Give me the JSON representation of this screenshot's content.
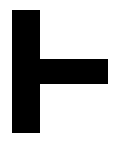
{
  "symbol": {
    "name": "right-tack",
    "glyph": "⊢",
    "color": "#000000",
    "background": "#ffffff"
  }
}
